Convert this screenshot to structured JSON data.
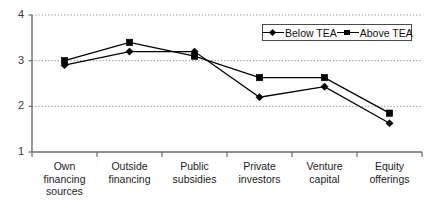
{
  "chart_data": {
    "type": "line",
    "title": "",
    "subtitle": "",
    "xlabel": "",
    "ylabel": "",
    "categories": [
      "Own financing sources",
      "Outside financing",
      "Public subsidies",
      "Private investors",
      "Venture capital",
      "Equity offerings"
    ],
    "category_lines": [
      [
        "Own financing",
        "sources"
      ],
      [
        "Outside",
        "financing"
      ],
      [
        "Public",
        "subsidies"
      ],
      [
        "Private",
        "investors"
      ],
      [
        "Venture",
        "capital"
      ],
      [
        "Equity",
        "offerings"
      ]
    ],
    "series": [
      {
        "name": "Below TEA",
        "marker": "diamond",
        "color": "#000000",
        "values": [
          2.9,
          3.2,
          3.2,
          2.2,
          2.43,
          1.63
        ]
      },
      {
        "name": "Above TEA",
        "marker": "square",
        "color": "#000000",
        "values": [
          3.0,
          3.4,
          3.1,
          2.63,
          2.63,
          1.85
        ]
      }
    ],
    "ylim": [
      1,
      4
    ],
    "yticks": [
      1,
      2,
      3,
      4
    ],
    "ytick_labels": [
      "1",
      "2",
      "3",
      "4"
    ],
    "grid": true,
    "grid_style": "dotted-horizontal",
    "legend_position": "top-right",
    "legend_entries": [
      "Below TEA",
      "Above TEA"
    ]
  },
  "colors": {
    "axis": "#6b6b6b",
    "grid": "#9a9a9a",
    "series": "#000000",
    "background": "#ffffff",
    "tick_text": "#3a3a3a",
    "label_text": "#1d1d1d"
  }
}
